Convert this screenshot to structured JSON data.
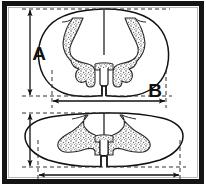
{
  "figure": {
    "kind": "anatomical-diagram",
    "background_color": "#ffffff",
    "frame": {
      "border_color": "#141414",
      "border_thickness_px": 5,
      "inset_px": 6
    },
    "ink_color": "#1a1a1a",
    "stipple_color": "#6e6e6e",
    "stipple_fill_tone": "#d8d8d8",
    "specimens": [
      {
        "id": "upper-section",
        "name": "cervical-spinal-cord-cross-section",
        "shape": "rounded-oval",
        "outline_color": "#111111",
        "gray_matter": "butterfly-stippled",
        "features": [
          "posterior-median-sulcus",
          "anterior-median-fissure",
          "dorsal-horn",
          "ventral-horn",
          "central-canal"
        ]
      },
      {
        "id": "lower-section",
        "name": "lumbosacral-spinal-cord-cross-section",
        "shape": "wide-flattened-oval",
        "outline_color": "#111111",
        "gray_matter": "broad-stippled-horns",
        "features": [
          "posterior-median-sulcus",
          "anterior-median-fissure",
          "enlarged-ventral-horn",
          "central-canal"
        ]
      }
    ],
    "dimensions": [
      {
        "id": "dim-a",
        "label": "A",
        "orientation": "vertical",
        "applies_to": "upper-section",
        "measures": "dorsoventral-height",
        "arrowheads": "both",
        "label_x": 39,
        "label_y": 60
      },
      {
        "id": "dim-b",
        "label": "B",
        "orientation": "horizontal",
        "applies_to": "upper-section",
        "measures": "transverse-width",
        "arrowheads": "both",
        "label_x": 155,
        "label_y": 97
      },
      {
        "id": "dim-a-lower",
        "label": "",
        "orientation": "vertical",
        "applies_to": "lower-section",
        "measures": "dorsoventral-height",
        "arrowheads": "both"
      },
      {
        "id": "dim-b-lower",
        "label": "",
        "orientation": "horizontal",
        "applies_to": "lower-section",
        "measures": "transverse-width",
        "arrowheads": "both"
      }
    ],
    "guide_lines": {
      "style": "dashed",
      "color": "#333333",
      "dash_pattern": "4 3"
    }
  }
}
